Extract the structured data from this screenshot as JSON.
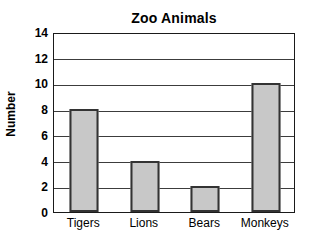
{
  "chart_data": {
    "type": "bar",
    "title": "Zoo Animals",
    "xlabel": "",
    "ylabel": "Number",
    "categories": [
      "Tigers",
      "Lions",
      "Bears",
      "Monkeys"
    ],
    "values": [
      8,
      4,
      2,
      10
    ],
    "ylim": [
      0,
      14
    ],
    "ytick_labels": [
      "0",
      "2",
      "4",
      "6",
      "8",
      "10",
      "12",
      "14"
    ],
    "yticks": [
      0,
      2,
      4,
      6,
      8,
      10,
      12,
      14
    ],
    "grid": true,
    "grid_axis": "y",
    "legend": false,
    "bar_fill_color": "#c8c8c8",
    "bar_edge_color": "#333333",
    "axis_color": "#1a1a1a",
    "background_color": "#ffffff",
    "text_color": "#000000"
  }
}
